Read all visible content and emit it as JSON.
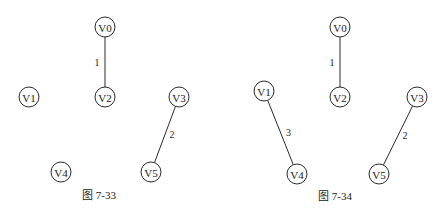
{
  "figures": [
    {
      "id": "fig-7-33",
      "caption": "图 7-33",
      "nodes": [
        "V0",
        "V1",
        "V2",
        "V3",
        "V4",
        "V5"
      ],
      "edges": [
        {
          "from": "V0",
          "to": "V2",
          "weight": "1"
        },
        {
          "from": "V3",
          "to": "V5",
          "weight": "2"
        }
      ]
    },
    {
      "id": "fig-7-34",
      "caption": "图 7-34",
      "nodes": [
        "V0",
        "V1",
        "V2",
        "V3",
        "V4",
        "V5"
      ],
      "edges": [
        {
          "from": "V0",
          "to": "V2",
          "weight": "1"
        },
        {
          "from": "V3",
          "to": "V5",
          "weight": "2"
        },
        {
          "from": "V1",
          "to": "V4",
          "weight": "3"
        }
      ]
    }
  ]
}
